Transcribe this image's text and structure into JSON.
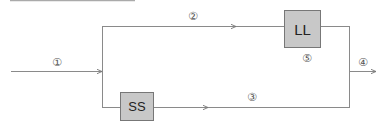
{
  "diagram": {
    "stroke_color": "#8a8a8a",
    "box_fill": "#c8c8c8",
    "boxes": [
      {
        "id": "LL",
        "label": "LL"
      },
      {
        "id": "SS",
        "label": "SS"
      }
    ],
    "labels": {
      "input": "①",
      "top_branch": "②",
      "bottom_branch": "③",
      "output": "④",
      "ll_output": "⑤"
    }
  }
}
